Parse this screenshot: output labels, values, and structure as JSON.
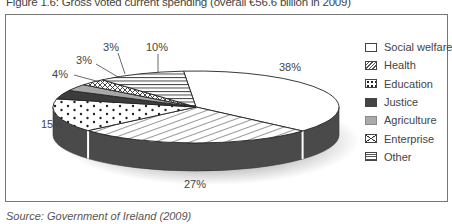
{
  "figure": {
    "title": "Figure 1.6: Gross voted current spending (overall €56.6 billion in 2009)",
    "source": "Source: Government of Ireland (2009)"
  },
  "legend": {
    "items": [
      {
        "label": "Social welfare",
        "pattern": "blank"
      },
      {
        "label": "Health",
        "pattern": "diagonal-hatch"
      },
      {
        "label": "Education",
        "pattern": "dots"
      },
      {
        "label": "Justice",
        "pattern": "solid-dark"
      },
      {
        "label": "Agriculture",
        "pattern": "solid-light-grey"
      },
      {
        "label": "Enterprise",
        "pattern": "cross-hatch"
      },
      {
        "label": "Other",
        "pattern": "horizontal-lines"
      }
    ]
  },
  "chart_data": {
    "type": "pie",
    "style": "3d",
    "title": "Figure 1.6: Gross voted current spending (overall €56.6 billion in 2009)",
    "categories": [
      "Social welfare",
      "Health",
      "Education",
      "Justice",
      "Agriculture",
      "Enterprise",
      "Other"
    ],
    "values": [
      38,
      27,
      15,
      4,
      3,
      3,
      10
    ],
    "value_labels": [
      "38%",
      "27%",
      "15%",
      "4%",
      "3%",
      "3%",
      "10%"
    ],
    "unit": "%",
    "total": "€56.6 billion",
    "year": "2009",
    "legend_position": "right",
    "colors": {
      "side": "#4a4a4a",
      "justice": "#3c3c3c",
      "agriculture": "#a8a8a8",
      "fill_light": "#ffffff",
      "line": "#222222"
    }
  }
}
